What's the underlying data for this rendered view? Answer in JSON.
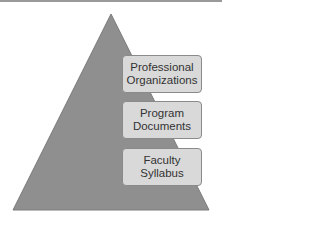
{
  "diagram": {
    "type": "pyramid",
    "colors": {
      "pyramid": "#8f8f8f",
      "box_fill": "#d9d9d9",
      "box_border": "#8a8a8a",
      "text": "#333333"
    },
    "levels": [
      {
        "line1": "Professional",
        "line2": "Organizations"
      },
      {
        "line1": "Program",
        "line2": "Documents"
      },
      {
        "line1": "Faculty",
        "line2": "Syllabus"
      }
    ]
  }
}
